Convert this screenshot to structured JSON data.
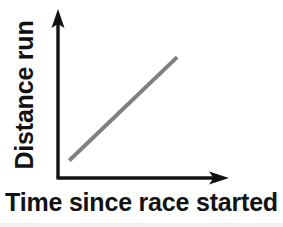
{
  "figure": {
    "width": 283,
    "height": 227,
    "background_color": "#ffffff",
    "axis_color": "#121212",
    "line_color": "#808080"
  },
  "labels": {
    "x_axis": "Time since race started",
    "y_axis": "Distance run"
  },
  "chart_data": {
    "type": "line",
    "title": "",
    "subtitle": "",
    "xlabel": "Time since race started",
    "ylabel": "Distance run",
    "xlim": [
      0,
      10
    ],
    "ylim": [
      0,
      10
    ],
    "grid": false,
    "legend": null,
    "axis_ticks": {
      "x": [],
      "y": []
    },
    "axis_arrows": {
      "x": "right",
      "y": "up"
    },
    "annotations": [],
    "series": [
      {
        "name": "Distance run",
        "color": "#808080",
        "line_width": 4,
        "x": [
          0.7,
          7.4
        ],
        "y": [
          1.1,
          7.6
        ],
        "description": "straight line with constant positive slope"
      }
    ]
  }
}
